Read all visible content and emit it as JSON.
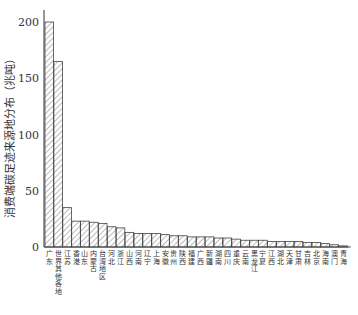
{
  "chart_data": {
    "type": "bar",
    "title": "",
    "xlabel": "",
    "ylabel": "消费端碳足迹来源地分布（兆吨）",
    "ylim": [
      0,
      210
    ],
    "yticks": [
      0,
      50,
      100,
      150,
      200
    ],
    "grid": false,
    "legend": null,
    "bar_style": "hatched",
    "categories": [
      "广东",
      "世界其他各地",
      "江苏",
      "香港",
      "山东",
      "内蒙古",
      "台湾地区",
      "河北",
      "浙江",
      "山西",
      "河南",
      "辽宁",
      "上海",
      "安徽",
      "贵州",
      "陕西",
      "福建",
      "广西",
      "新疆",
      "湖南",
      "四川",
      "重庆",
      "云南",
      "黑龙江",
      "宁夏",
      "江西",
      "湖北",
      "天津",
      "甘肃",
      "吉林",
      "北京",
      "海南",
      "澳门",
      "青海"
    ],
    "values": [
      200,
      165,
      35,
      23,
      23,
      22,
      21,
      18,
      17,
      13,
      12,
      12,
      12,
      11,
      10,
      10,
      9,
      9,
      9,
      8,
      8,
      7,
      6,
      6,
      6,
      5,
      5,
      5,
      5,
      4,
      4,
      3,
      2,
      1
    ]
  }
}
